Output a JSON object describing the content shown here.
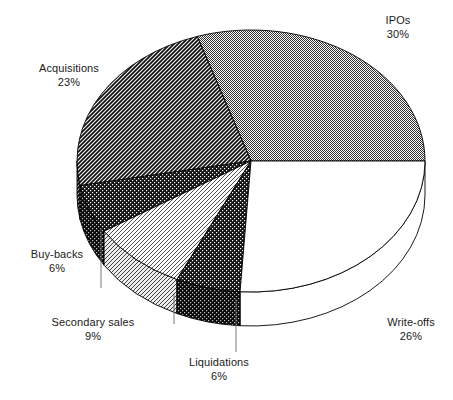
{
  "chart_data": {
    "type": "pie",
    "title": "",
    "subtitle": "",
    "xlabel": "",
    "ylabel": "",
    "legend_position": "none",
    "grid": false,
    "three_d": true,
    "start_angle_deg": 0,
    "direction": "counterclockwise",
    "categories": [
      "IPOs",
      "Acquisitions",
      "Buy-backs",
      "Secondary sales",
      "Liquidations",
      "Write-offs"
    ],
    "values": [
      30,
      23,
      6,
      9,
      6,
      26
    ],
    "value_unit": "%",
    "slices": [
      {
        "label": "IPOs",
        "value": 30,
        "value_text": "30%",
        "fill": "#808080",
        "pattern": "checker-gray",
        "stroke": "#000000"
      },
      {
        "label": "Acquisitions",
        "value": 23,
        "value_text": "23%",
        "fill": "#2b2b2b",
        "pattern": "diagonal-hatch-dark",
        "stroke": "#000000"
      },
      {
        "label": "Buy-backs",
        "value": 6,
        "value_text": "6%",
        "fill": "#1a1a1a",
        "pattern": "dots-dark",
        "stroke": "#000000"
      },
      {
        "label": "Secondary sales",
        "value": 9,
        "value_text": "9%",
        "fill": "#ffffff",
        "pattern": "diagonal-lines-light",
        "stroke": "#000000"
      },
      {
        "label": "Liquidations",
        "value": 6,
        "value_text": "6%",
        "fill": "#1a1a1a",
        "pattern": "dots-dark",
        "stroke": "#000000"
      },
      {
        "label": "Write-offs",
        "value": 26,
        "value_text": "26%",
        "fill": "#ffffff",
        "pattern": "solid-white",
        "stroke": "#000000"
      }
    ]
  },
  "labels": {
    "ipos": {
      "name": "IPOs",
      "value": "30%"
    },
    "acquisitions": {
      "name": "Acquisitions",
      "value": "23%"
    },
    "buybacks": {
      "name": "Buy-backs",
      "value": "6%"
    },
    "secondary_sales": {
      "name": "Secondary sales",
      "value": "9%"
    },
    "liquidations": {
      "name": "Liquidations",
      "value": "6%"
    },
    "writeoffs": {
      "name": "Write-offs",
      "value": "26%"
    }
  },
  "colors": {
    "background": "#ffffff",
    "outline": "#000000",
    "text": "#1a1a1a",
    "leader_line": "#5a5a5a",
    "gray_slice": "#808080",
    "dark_slice": "#1f1f1f"
  }
}
